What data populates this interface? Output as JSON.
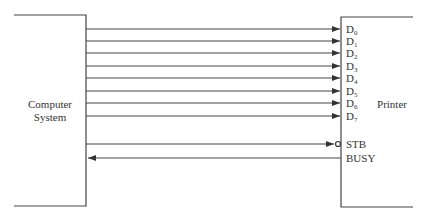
{
  "diagram": {
    "left_block": {
      "lines": [
        "Computer",
        "System"
      ]
    },
    "right_block": {
      "label": "Printer"
    },
    "data_lines": [
      {
        "name": "D",
        "sub": "0",
        "y": 29
      },
      {
        "name": "D",
        "sub": "1",
        "y": 41
      },
      {
        "name": "D",
        "sub": "2",
        "y": 53
      },
      {
        "name": "D",
        "sub": "3",
        "y": 66
      },
      {
        "name": "D",
        "sub": "4",
        "y": 78
      },
      {
        "name": "D",
        "sub": "5",
        "y": 91
      },
      {
        "name": "D",
        "sub": "6",
        "y": 103
      },
      {
        "name": "D",
        "sub": "7",
        "y": 116
      }
    ],
    "control_lines": [
      {
        "label": "STB",
        "direction": "to-printer",
        "active_low": true,
        "y": 144
      },
      {
        "label": "BUSY",
        "direction": "to-computer",
        "active_low": false,
        "y": 158
      }
    ],
    "colors": {
      "line": "#444444",
      "text": "#333333"
    }
  }
}
